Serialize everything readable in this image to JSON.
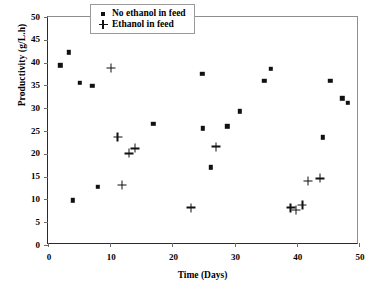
{
  "chart_data": {
    "type": "scatter",
    "title": "",
    "xlabel": "Time (Days)",
    "ylabel": "Productivity (g/L.h)",
    "xlim": [
      0,
      50
    ],
    "ylim": [
      0,
      50
    ],
    "xticks": [
      0,
      10,
      20,
      30,
      40,
      50
    ],
    "yticks": [
      0,
      5,
      10,
      15,
      20,
      25,
      30,
      35,
      40,
      45,
      50
    ],
    "grid": false,
    "legend_position": "top-center",
    "series": [
      {
        "name": "No ethanol in feed",
        "marker": "square",
        "color": "#111111",
        "points": [
          {
            "x": 2.0,
            "y": 39.4
          },
          {
            "x": 3.3,
            "y": 42.3
          },
          {
            "x": 4.0,
            "y": 9.8
          },
          {
            "x": 5.1,
            "y": 35.6
          },
          {
            "x": 7.1,
            "y": 34.9
          },
          {
            "x": 8.0,
            "y": 12.8
          },
          {
            "x": 16.9,
            "y": 26.6
          },
          {
            "x": 24.8,
            "y": 37.6
          },
          {
            "x": 24.9,
            "y": 25.6
          },
          {
            "x": 26.2,
            "y": 17.0
          },
          {
            "x": 28.8,
            "y": 26.0
          },
          {
            "x": 30.8,
            "y": 29.3
          },
          {
            "x": 34.8,
            "y": 36.0
          },
          {
            "x": 35.8,
            "y": 38.6
          },
          {
            "x": 44.2,
            "y": 23.6
          },
          {
            "x": 45.4,
            "y": 36.0
          },
          {
            "x": 47.3,
            "y": 32.2
          },
          {
            "x": 48.2,
            "y": 31.2
          }
        ]
      },
      {
        "name": "Ethanol in feed",
        "marker": "plus",
        "color": "#111111",
        "points": [
          {
            "x": 10.1,
            "y": 38.8
          },
          {
            "x": 11.2,
            "y": 23.7
          },
          {
            "x": 11.9,
            "y": 13.1
          },
          {
            "x": 13.0,
            "y": 20.1
          },
          {
            "x": 14.0,
            "y": 21.2
          },
          {
            "x": 23.0,
            "y": 8.2
          },
          {
            "x": 27.0,
            "y": 21.6
          },
          {
            "x": 39.0,
            "y": 8.2
          },
          {
            "x": 39.9,
            "y": 7.7
          },
          {
            "x": 40.9,
            "y": 8.8
          },
          {
            "x": 41.8,
            "y": 14.0
          },
          {
            "x": 43.7,
            "y": 14.6
          }
        ]
      }
    ]
  },
  "legend": {
    "items": [
      {
        "label": "No ethanol in feed",
        "marker": "square"
      },
      {
        "label": "Ethanol in feed",
        "marker": "plus"
      }
    ]
  }
}
